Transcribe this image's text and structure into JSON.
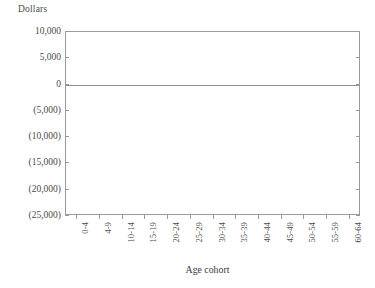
{
  "chart_data": {
    "type": "bar",
    "title": "",
    "xlabel": "Age cohort",
    "ylabel": "Dollars",
    "categories": [
      "0-4",
      "4-9",
      "10-14",
      "15-19",
      "20-24",
      "25-29",
      "30-34",
      "35-39",
      "40-44",
      "45-49",
      "50-54",
      "55-59",
      "60-64"
    ],
    "values": [
      10000,
      9400,
      9300,
      9100,
      9400,
      7900,
      6400,
      1100,
      -3400,
      -7700,
      -12800,
      -15600,
      -23000
    ],
    "ylim": [
      -25000,
      10000
    ],
    "ytick_values": [
      10000,
      5000,
      0,
      -5000,
      -10000,
      -15000,
      -20000,
      -25000
    ],
    "ytick_labels": [
      "10,000",
      "5,000",
      "0",
      "(5,000)",
      "(10,000)",
      "(15,000)",
      "(20,000)",
      "(25,000)"
    ],
    "grid": false,
    "legend": null,
    "bar_color": "#a9a9a9",
    "axis_color": "#9a9a9a",
    "xtick_rotation": 90
  },
  "figure": {
    "y_axis_title": "Dollars",
    "x_axis_title": "Age cohort"
  }
}
